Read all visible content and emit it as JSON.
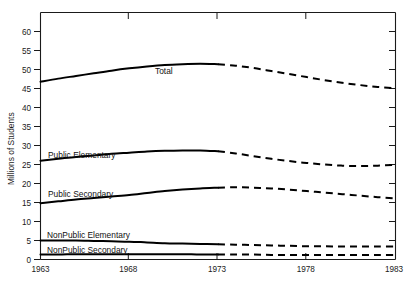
{
  "chart_data": {
    "type": "line",
    "title": "",
    "subtitle": "",
    "xlabel": "",
    "ylabel": "Millions of Students",
    "xlim": [
      1963,
      1983
    ],
    "ylim": [
      0,
      65
    ],
    "grid": false,
    "legend_position": "inline-labels",
    "xticks": [
      1963,
      1968,
      1973,
      1978,
      1983
    ],
    "xtick_labels": [
      "1963",
      "1968",
      "1973",
      "1978",
      "1983"
    ],
    "yticks": [
      0,
      5,
      10,
      15,
      20,
      25,
      30,
      35,
      40,
      45,
      50,
      55,
      60,
      65
    ],
    "ytick_labels": [
      "0",
      "5",
      "10",
      "15",
      "20",
      "25",
      "30",
      "35",
      "40",
      "45",
      "50",
      "55",
      "60",
      ""
    ],
    "annotation": "Solid lines are actual data through 1973; dashed lines are projections 1973-1983.",
    "x": [
      1963,
      1964,
      1965,
      1966,
      1967,
      1968,
      1969,
      1970,
      1971,
      1972,
      1973,
      1974,
      1975,
      1976,
      1977,
      1978,
      1979,
      1980,
      1981,
      1982,
      1983
    ],
    "series": [
      {
        "name": "Total",
        "label": "Total",
        "style": "solid-then-dashed",
        "split_x": 1973,
        "values": [
          46.8,
          47.6,
          48.3,
          49.0,
          49.7,
          50.3,
          50.8,
          51.2,
          51.4,
          51.5,
          51.4,
          51.0,
          50.4,
          49.6,
          48.8,
          48.0,
          47.2,
          46.5,
          45.9,
          45.4,
          45.1
        ]
      },
      {
        "name": "Public Elementary",
        "label": "Public Elementary",
        "style": "solid-then-dashed",
        "split_x": 1973,
        "values": [
          26.0,
          26.5,
          27.0,
          27.4,
          27.8,
          28.1,
          28.4,
          28.6,
          28.7,
          28.7,
          28.5,
          27.9,
          27.2,
          26.5,
          25.9,
          25.4,
          25.0,
          24.7,
          24.6,
          24.7,
          24.9
        ]
      },
      {
        "name": "Public Secondary",
        "label": "Public Secondary",
        "style": "solid-then-dashed",
        "split_x": 1973,
        "values": [
          14.8,
          15.3,
          15.8,
          16.2,
          16.6,
          17.0,
          17.5,
          18.0,
          18.4,
          18.7,
          18.9,
          19.0,
          18.9,
          18.7,
          18.4,
          18.0,
          17.6,
          17.2,
          16.8,
          16.4,
          16.1
        ]
      },
      {
        "name": "NonPublic Elementary",
        "label": "NonPublic Elementary",
        "style": "solid-then-dashed",
        "split_x": 1973,
        "values": [
          5.0,
          5.0,
          5.0,
          4.9,
          4.8,
          4.7,
          4.5,
          4.3,
          4.2,
          4.1,
          4.0,
          3.9,
          3.8,
          3.7,
          3.6,
          3.5,
          3.5,
          3.4,
          3.4,
          3.4,
          3.4
        ]
      },
      {
        "name": "NonPublic Secondary",
        "label": "NonPublic Secondary",
        "style": "solid-then-dashed",
        "split_x": 1973,
        "values": [
          1.3,
          1.3,
          1.4,
          1.4,
          1.4,
          1.4,
          1.4,
          1.4,
          1.4,
          1.3,
          1.3,
          1.3,
          1.3,
          1.2,
          1.2,
          1.2,
          1.2,
          1.2,
          1.2,
          1.2,
          1.2
        ]
      }
    ]
  },
  "axis": {
    "ylabel": "Millions of Students"
  },
  "labels": {
    "total": "Total",
    "public_elementary": "Public Elementary",
    "public_secondary": "Public Secondary",
    "nonpublic_elementary": "NonPublic Elementary",
    "nonpublic_secondary": "NonPublic Secondary"
  },
  "xticks": {
    "t0": "1963",
    "t1": "1968",
    "t2": "1973",
    "t3": "1978",
    "t4": "1983"
  },
  "yticks": {
    "y0": "0",
    "y5": "5",
    "y10": "10",
    "y15": "15",
    "y20": "20",
    "y25": "25",
    "y30": "30",
    "y35": "35",
    "y40": "40",
    "y45": "45",
    "y50": "50",
    "y55": "55",
    "y60": "60"
  }
}
